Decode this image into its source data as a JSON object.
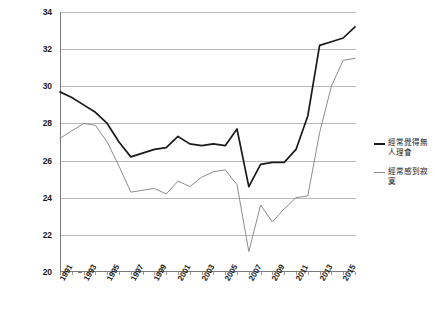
{
  "chart_data": {
    "type": "line",
    "title": "",
    "xlabel": "",
    "ylabel": "",
    "ylim": [
      20,
      34
    ],
    "xlim": [
      1991,
      2016
    ],
    "grid": true,
    "legend_position": "right",
    "y_ticks": [
      34,
      32,
      30,
      28,
      26,
      24,
      22,
      20
    ],
    "x_ticks": [
      1991,
      1993,
      1995,
      1997,
      1999,
      2001,
      2003,
      2005,
      2007,
      2009,
      2011,
      2013,
      2015
    ],
    "x": [
      1991,
      1992,
      1993,
      1994,
      1995,
      1996,
      1997,
      1998,
      1999,
      2000,
      2001,
      2002,
      2003,
      2004,
      2005,
      2006,
      2007,
      2008,
      2009,
      2010,
      2011,
      2012,
      2013,
      2014,
      2015,
      2016
    ],
    "series": [
      {
        "name": "經常覺得無人理會",
        "color": "#1a1a1a",
        "values": [
          29.7,
          29.4,
          29.0,
          28.6,
          28.0,
          27.0,
          26.2,
          26.4,
          26.6,
          26.7,
          27.3,
          26.9,
          26.8,
          26.9,
          26.8,
          27.7,
          24.6,
          25.8,
          25.9,
          25.9,
          26.6,
          28.4,
          32.2,
          32.4,
          32.6,
          33.2
        ]
      },
      {
        "name": "經常感到寂寞",
        "color": "#8c8c8c",
        "values": [
          27.2,
          27.6,
          28.0,
          27.9,
          27.0,
          25.7,
          24.3,
          24.4,
          24.5,
          24.2,
          24.9,
          24.6,
          25.1,
          25.4,
          25.5,
          24.7,
          21.1,
          23.6,
          22.7,
          23.4,
          24.0,
          24.1,
          27.5,
          30.0,
          31.4,
          31.5
        ]
      }
    ]
  },
  "legend": {
    "entries": [
      {
        "label": "經常覺得無人理會",
        "color": "#1a1a1a"
      },
      {
        "label": "經常感到寂寞",
        "color": "#8c8c8c"
      }
    ]
  }
}
